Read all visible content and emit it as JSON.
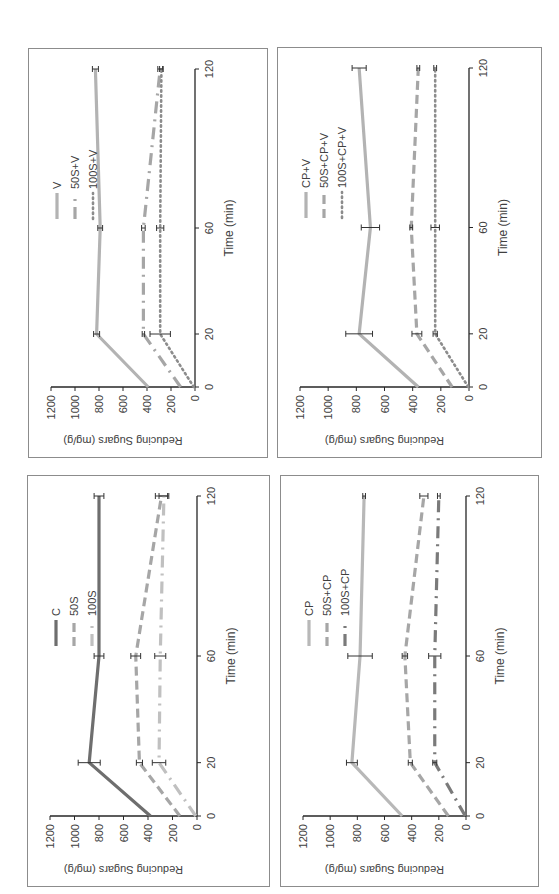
{
  "chart_data": [
    {
      "type": "line",
      "panel": "top-left",
      "xlabel": "Time (min)",
      "ylabel": "Reducing Sugars (mg/g)",
      "x": [
        0,
        20,
        60,
        120
      ],
      "xticks": [
        "0",
        "20",
        "60",
        "120"
      ],
      "yticks": [
        "0",
        "200",
        "400",
        "600",
        "800",
        "1000",
        "1200"
      ],
      "ylim": [
        0,
        1200
      ],
      "xlim": [
        0,
        120
      ],
      "grid": false,
      "legend_position": "upper-right",
      "rotation": "90deg counter-clockwise",
      "series": [
        {
          "name": "V",
          "values": [
            390,
            820,
            790,
            830
          ],
          "errors": [
            0,
            25,
            20,
            25
          ],
          "style": "solid",
          "color": "#b3b3b3"
        },
        {
          "name": "50S+V",
          "values": [
            120,
            430,
            430,
            290
          ],
          "errors": [
            0,
            10,
            15,
            20
          ],
          "style": "dash-dot",
          "color": "#a6a6a6"
        },
        {
          "name": "100S+V",
          "values": [
            10,
            290,
            290,
            280
          ],
          "errors": [
            0,
            85,
            30,
            15
          ],
          "style": "dotted",
          "color": "#8c8c8c"
        }
      ]
    },
    {
      "type": "line",
      "panel": "top-right",
      "xlabel": "Time (min)",
      "ylabel": "Reducing Sugars (mg/g)",
      "x": [
        0,
        20,
        60,
        120
      ],
      "xticks": [
        "0",
        "20",
        "60",
        "120"
      ],
      "yticks": [
        "0",
        "200",
        "400",
        "600",
        "800",
        "1000",
        "1200"
      ],
      "ylim": [
        0,
        1200
      ],
      "xlim": [
        0,
        120
      ],
      "grid": false,
      "legend_position": "upper-right",
      "rotation": "90deg counter-clockwise",
      "series": [
        {
          "name": "CP+V",
          "values": [
            360,
            780,
            700,
            780
          ],
          "errors": [
            0,
            95,
            65,
            50
          ],
          "style": "solid",
          "color": "#b3b3b3"
        },
        {
          "name": "50S+CP+V",
          "values": [
            120,
            370,
            410,
            360
          ],
          "errors": [
            0,
            35,
            10,
            10
          ],
          "style": "dashed",
          "color": "#a6a6a6"
        },
        {
          "name": "100S+CP+V",
          "values": [
            5,
            240,
            240,
            240
          ],
          "errors": [
            0,
            15,
            30,
            10
          ],
          "style": "dotted",
          "color": "#8c8c8c"
        }
      ]
    },
    {
      "type": "line",
      "panel": "bottom-left",
      "xlabel": "Time (min)",
      "ylabel": "Reducing Sugars (mg/g)",
      "x": [
        0,
        20,
        60,
        120
      ],
      "xticks": [
        "0",
        "20",
        "60",
        "120"
      ],
      "yticks": [
        "0",
        "200",
        "400",
        "600",
        "800",
        "1000",
        "1200"
      ],
      "ylim": [
        0,
        1200
      ],
      "xlim": [
        0,
        120
      ],
      "grid": false,
      "legend_position": "upper-right",
      "rotation": "90deg counter-clockwise",
      "series": [
        {
          "name": "C",
          "values": [
            380,
            880,
            800,
            800
          ],
          "errors": [
            0,
            90,
            40,
            40
          ],
          "style": "solid",
          "color": "#6e6e6e"
        },
        {
          "name": "50S",
          "values": [
            140,
            470,
            500,
            290
          ],
          "errors": [
            0,
            25,
            40,
            50
          ],
          "style": "dashed",
          "color": "#a6a6a6"
        },
        {
          "name": "100S",
          "values": [
            10,
            310,
            300,
            270
          ],
          "errors": [
            0,
            55,
            45,
            40
          ],
          "style": "dash-dot",
          "color": "#c0c0c0"
        }
      ]
    },
    {
      "type": "line",
      "panel": "bottom-right",
      "xlabel": "Time (min)",
      "ylabel": "Reducing Sugars (mg/g)",
      "x": [
        0,
        20,
        60,
        120
      ],
      "xticks": [
        "0",
        "20",
        "60",
        "120"
      ],
      "yticks": [
        "0",
        "200",
        "400",
        "600",
        "800",
        "1000",
        "1200"
      ],
      "ylim": [
        0,
        1200
      ],
      "xlim": [
        0,
        120
      ],
      "grid": false,
      "legend_position": "upper-right",
      "rotation": "90deg counter-clockwise",
      "series": [
        {
          "name": "CP",
          "values": [
            470,
            840,
            780,
            750
          ],
          "errors": [
            0,
            40,
            90,
            10
          ],
          "style": "solid",
          "color": "#b8b8b8"
        },
        {
          "name": "50S+CP",
          "values": [
            130,
            410,
            450,
            310
          ],
          "errors": [
            0,
            15,
            20,
            30
          ],
          "style": "dashed",
          "color": "#a6a6a6"
        },
        {
          "name": "100S+CP",
          "values": [
            5,
            230,
            230,
            200
          ],
          "errors": [
            0,
            15,
            45,
            10
          ],
          "style": "dash-dot",
          "color": "#7a7a7a"
        }
      ]
    }
  ],
  "panels": [
    {
      "id": "top-left",
      "left": 28,
      "top": 48,
      "width": 240,
      "height": 410
    },
    {
      "id": "top-right",
      "left": 277,
      "top": 47,
      "width": 265,
      "height": 411
    },
    {
      "id": "bottom-left",
      "left": 27,
      "top": 475,
      "width": 243,
      "height": 412
    },
    {
      "id": "bottom-right",
      "left": 280,
      "top": 475,
      "width": 259,
      "height": 412
    }
  ]
}
